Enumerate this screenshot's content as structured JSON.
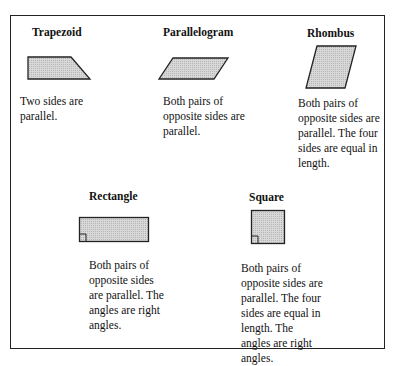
{
  "shapes": [
    {
      "name": "Trapezoid",
      "description": "Two sides are parallel."
    },
    {
      "name": "Parallelogram",
      "description": "Both pairs of opposite sides are parallel."
    },
    {
      "name": "Rhombus",
      "description": "Both pairs of opposite sides are parallel. The four sides are equal in length."
    },
    {
      "name": "Rectangle",
      "description": "Both pairs of opposite sides are parallel. The angles are right angles."
    },
    {
      "name": "Square",
      "description": "Both pairs of opposite sides are parallel. The four sides are equal in length. The angles are right angles."
    }
  ],
  "colors": {
    "fill": "#cfcfcf",
    "stroke": "#222222"
  }
}
